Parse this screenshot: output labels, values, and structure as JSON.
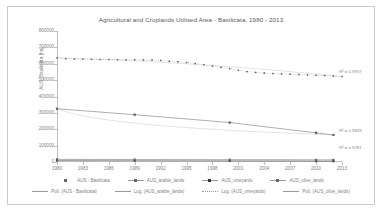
{
  "chart_data": {
    "type": "line",
    "title": "Agricultural and Croplands Utilised Area - Basilicata, 1980 - 2013",
    "xlabel": "",
    "ylabel": "AUS_Basilicata [ha]",
    "ylim": [
      0,
      800000
    ],
    "xlim": [
      1980,
      2013
    ],
    "grid": false,
    "legend_position": "bottom",
    "yticks": [
      "0",
      "100000",
      "200000",
      "300000",
      "400000",
      "500000",
      "600000",
      "700000",
      "800000"
    ],
    "ytick_values": [
      0,
      100000,
      200000,
      300000,
      400000,
      500000,
      600000,
      700000,
      800000
    ],
    "xticks": [
      "1980",
      "1983",
      "1986",
      "1989",
      "1992",
      "1995",
      "1998",
      "2001",
      "2004",
      "2007",
      "2010",
      "2013"
    ],
    "xtick_values": [
      1980,
      1983,
      1986,
      1989,
      1992,
      1995,
      1998,
      2001,
      2004,
      2007,
      2010,
      2013
    ],
    "x": [
      1980,
      1981,
      1982,
      1983,
      1984,
      1985,
      1986,
      1987,
      1988,
      1989,
      1990,
      1991,
      1992,
      1993,
      1994,
      1995,
      1996,
      1997,
      1998,
      1999,
      2000,
      2001,
      2002,
      2003,
      2004,
      2005,
      2006,
      2007,
      2008,
      2009,
      2010,
      2011,
      2012,
      2013
    ],
    "series": [
      {
        "name": "AUS - Basilicata",
        "marker": "square",
        "color": "#595959",
        "values": [
          636000,
          631000,
          629000,
          628000,
          627000,
          626000,
          626000,
          625000,
          624000,
          624000,
          623000,
          622000,
          620000,
          615000,
          612000,
          607000,
          601000,
          594000,
          586000,
          578000,
          570000,
          560000,
          552000,
          547000,
          543000,
          540000,
          538000,
          536000,
          534000,
          532000,
          530000,
          528000,
          525000,
          522000
        ]
      },
      {
        "name": "AUS_arable_lands",
        "marker": "square",
        "color": "#595959",
        "values": [
          325000,
          null,
          null,
          null,
          null,
          null,
          null,
          null,
          null,
          289000,
          null,
          null,
          null,
          null,
          null,
          null,
          null,
          null,
          null,
          null,
          241000,
          null,
          null,
          null,
          null,
          null,
          null,
          null,
          null,
          null,
          178000,
          null,
          165000,
          null
        ]
      },
      {
        "name": "AUS_vineyards",
        "marker": "square",
        "color": "#404040",
        "values": [
          9000,
          null,
          null,
          null,
          null,
          null,
          null,
          null,
          null,
          8000,
          null,
          null,
          null,
          null,
          null,
          null,
          null,
          null,
          null,
          null,
          7000,
          null,
          null,
          null,
          null,
          null,
          null,
          null,
          null,
          null,
          5500,
          null,
          5000,
          null
        ]
      },
      {
        "name": "AUS_olive_lands",
        "marker": "square",
        "color": "#595959",
        "values": [
          16000,
          null,
          null,
          null,
          null,
          null,
          null,
          null,
          null,
          15000,
          null,
          null,
          null,
          null,
          null,
          null,
          null,
          null,
          null,
          null,
          14000,
          null,
          null,
          null,
          null,
          null,
          null,
          null,
          null,
          null,
          13000,
          null,
          12500,
          null
        ]
      }
    ],
    "trendlines": [
      {
        "name": "Poli. (AUS - Basilicata)",
        "type": "polynomial",
        "r2_label": "R² = 0.9937"
      },
      {
        "name": "Log. (AUS_arable_lands)",
        "type": "logarithmic",
        "r2_label": "R² = 0.9849"
      },
      {
        "name": "Log. (AUS_vineyards)",
        "type": "logarithmic",
        "r2_label": "R² = 0.9781"
      },
      {
        "name": "Poli. (AUS_olive_lands)",
        "type": "polynomial",
        "r2_label": "R² = 0.9782"
      }
    ],
    "annotations": [
      {
        "text": "R² = 0.9937",
        "near": "AUS - Basilicata"
      },
      {
        "text": "R² = 0.9849",
        "near": "AUS_arable_lands"
      },
      {
        "text": "R² = 0.9781",
        "near": "AUS_vineyards"
      }
    ]
  },
  "legend": {
    "row1": [
      {
        "label": "AUS - Basilicata",
        "key": "marker-only"
      },
      {
        "label": "AUS_arable_lands",
        "key": "line-marker"
      },
      {
        "label": "AUS_vineyards",
        "key": "line-marker-bold"
      },
      {
        "label": "AUS_olive_lands",
        "key": "line-marker"
      }
    ],
    "row2": [
      {
        "label": "Poli. (AUS - Basilicata)",
        "key": "line"
      },
      {
        "label": "Log. (AUS_arable_lands)",
        "key": "line"
      },
      {
        "label": "Log. (AUS_vineyards)",
        "key": "line-dotted"
      },
      {
        "label": "Poli. (AUS_olive_lands)",
        "key": "line"
      }
    ]
  }
}
